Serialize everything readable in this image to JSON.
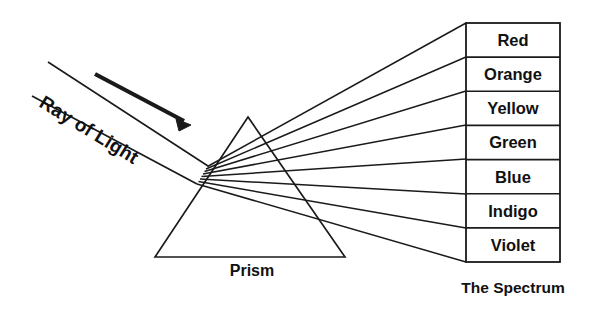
{
  "diagram": {
    "title_caption": "The Spectrum",
    "prism_label": "Prism",
    "ray_label": "Ray of Light",
    "stroke_color": "#1a1a1a",
    "text_color": "#111111",
    "background_color": "#ffffff",
    "spectrum_bands": [
      {
        "name": "Red"
      },
      {
        "name": "Orange"
      },
      {
        "name": "Yellow"
      },
      {
        "name": "Green"
      },
      {
        "name": "Blue"
      },
      {
        "name": "Indigo"
      },
      {
        "name": "Violet"
      }
    ],
    "band_count": "7",
    "arrow_icon": "arrow-right-icon",
    "prism_shape": "triangle"
  }
}
